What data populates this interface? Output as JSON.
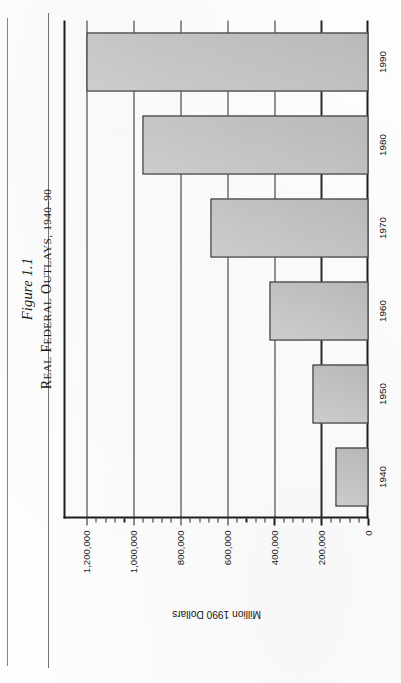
{
  "page": {
    "background_color": "#fdfdfd",
    "rule_color": "#5b5b5b"
  },
  "caption": {
    "figure_number": "Figure 1.1",
    "title_small_caps": "R",
    "title_rest": "EAL ",
    "title": "Real Federal Outlays, 1940–90",
    "title_parts": [
      {
        "cap": "R",
        "rest": "EAL"
      },
      {
        "cap": "F",
        "rest": "EDERAL"
      },
      {
        "cap": "O",
        "rest": "UTLAYS,"
      },
      {
        "cap": "",
        "rest": "1940–90"
      }
    ]
  },
  "chart_data": {
    "type": "bar",
    "orientation": "horizontal",
    "title": "Real Federal Outlays, 1940–90",
    "figure_number": "Figure 1.1",
    "categories": [
      "1940",
      "1950",
      "1960",
      "1970",
      "1980",
      "1990"
    ],
    "values": [
      142000,
      238000,
      422000,
      673000,
      963000,
      1200000
    ],
    "xlabel": "",
    "ylabel": "Million 1990 Dollars",
    "ylim": [
      0,
      1300000
    ],
    "tick_values": [
      0,
      200000,
      400000,
      600000,
      800000,
      1000000,
      1200000
    ],
    "tick_labels": [
      "0",
      "200,000",
      "400,000",
      "600,000",
      "800,000",
      "1,000,000",
      "1,200,000"
    ],
    "minor_ticks_between_majors": 4,
    "grid": true,
    "legend": null,
    "bar_fill_color": "#c3c3c3",
    "bar_edge_color": "#1d1d1d",
    "axis_color": "#1e1e1e"
  }
}
